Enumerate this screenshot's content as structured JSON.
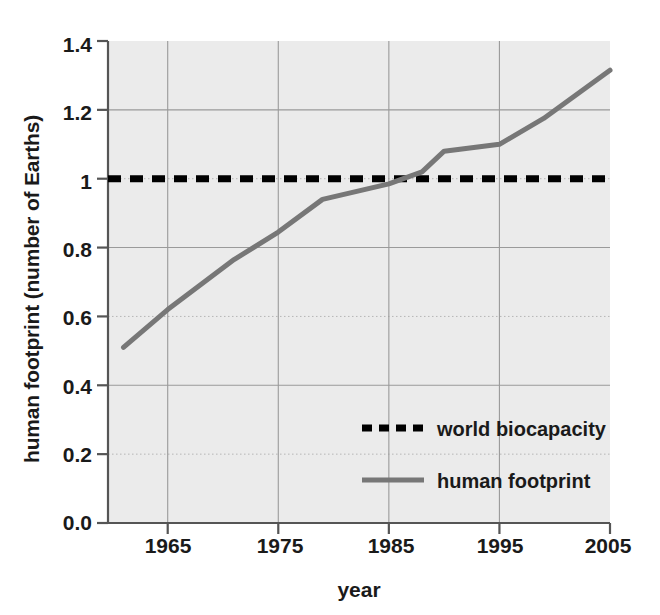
{
  "chart_data": {
    "type": "line",
    "title": "",
    "xlabel": "year",
    "ylabel": "human footprint (number of Earths)",
    "xlim": [
      1959.6,
      2005
    ],
    "ylim": [
      0.0,
      1.4
    ],
    "grid": true,
    "legend_position": "center-right-inside",
    "xticks": [
      "1965",
      "1975",
      "1985",
      "1995",
      "2005"
    ],
    "xtick_values": [
      1965,
      1975,
      1985,
      1995,
      2005
    ],
    "yticks": [
      "0.0",
      "0.2",
      "0.4",
      "0.6",
      "0.8",
      "1",
      "1.2",
      "1.4"
    ],
    "ytick_values": [
      0.0,
      0.2,
      0.4,
      0.6,
      0.8,
      1.0,
      1.2,
      1.4
    ],
    "series": [
      {
        "name": "world biocapacity",
        "style": "dashed",
        "color": "#000000",
        "x": [
          1959.6,
          2005
        ],
        "values": [
          1.0,
          1.0
        ]
      },
      {
        "name": "human footprint",
        "style": "solid",
        "color": "#777777",
        "x": [
          1961,
          1965,
          1971,
          1975,
          1979,
          1985,
          1988,
          1990,
          1995,
          1999,
          2005
        ],
        "values": [
          0.51,
          0.62,
          0.765,
          0.845,
          0.94,
          0.985,
          1.02,
          1.08,
          1.1,
          1.175,
          1.315
        ]
      }
    ]
  },
  "legend": {
    "entries": [
      {
        "label": "world biocapacity",
        "swatch": "dashed-black"
      },
      {
        "label": "human footprint",
        "swatch": "solid-gray"
      }
    ]
  },
  "colors": {
    "plot_background": "#ebebeb",
    "page_background": "#ffffff",
    "axis": "#555555",
    "gridline": "#9a9a9a",
    "gridline_minor": "#b5b5b5",
    "footprint_line": "#777777",
    "biocapacity_line": "#000000",
    "text": "#1a1a1a"
  }
}
